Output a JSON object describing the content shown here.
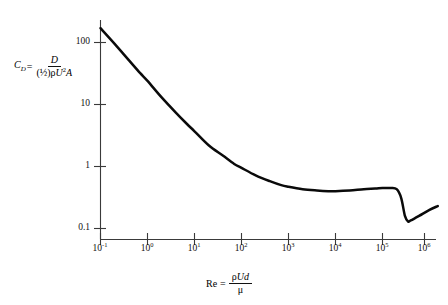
{
  "figure": {
    "background_color": "#ffffff",
    "curve_color": "#0a0a0a",
    "axis_color": "#3a3a3a"
  },
  "axis_titles": {
    "y": {
      "lhs_symbol": "C",
      "lhs_subscript": "D",
      "equals": "=",
      "numerator": "D",
      "denominator_prefix": "(½)",
      "denominator_rho": "ρ",
      "denominator_u": "U",
      "denominator_exp": "2",
      "denominator_area": "A",
      "plain": "C_D = D / ((½)ρU²A)"
    },
    "x": {
      "lhs": "Re",
      "equals": "=",
      "numerator_rho": "ρ",
      "numerator_u": "U",
      "numerator_d": "d",
      "denominator": "μ",
      "plain": "Re = ρUd / μ"
    }
  },
  "chart_data": {
    "type": "line",
    "title": "",
    "xlabel": "Re = ρUd/μ",
    "ylabel": "C_D = D/((½)ρU²A)",
    "xscale": "log",
    "yscale": "log",
    "xlim": [
      0.1,
      2000000
    ],
    "ylim": [
      0.07,
      300
    ],
    "grid": false,
    "legend": null,
    "xticks": [
      0.1,
      1,
      10,
      100,
      1000,
      10000,
      100000,
      1000000
    ],
    "xtick_labels": [
      "10-1",
      "100",
      "101",
      "102",
      "103",
      "104",
      "105",
      "106"
    ],
    "xtick_mantissa": [
      "10",
      "10",
      "10",
      "10",
      "10",
      "10",
      "10",
      "10"
    ],
    "xtick_exponents": [
      "-1",
      "0",
      "1",
      "2",
      "3",
      "4",
      "5",
      "6"
    ],
    "yticks": [
      0.1,
      1,
      10,
      100
    ],
    "ytick_labels": [
      "0.1",
      "1",
      "10",
      "100"
    ],
    "series": [
      {
        "name": "drag coefficient",
        "x": [
          0.1,
          0.2,
          0.4,
          0.7,
          1,
          2,
          4,
          7,
          10,
          20,
          40,
          70,
          100,
          200,
          400,
          700,
          1000,
          2000,
          4000,
          7000,
          10000,
          20000,
          40000,
          70000,
          100000,
          150000,
          200000,
          250000,
          300000,
          350000,
          400000,
          600000,
          1000000,
          1500000
        ],
        "y": [
          170,
          95,
          52,
          32,
          24,
          13,
          7.4,
          4.8,
          3.7,
          2.2,
          1.5,
          1.1,
          0.95,
          0.72,
          0.58,
          0.5,
          0.47,
          0.43,
          0.41,
          0.4,
          0.4,
          0.41,
          0.43,
          0.44,
          0.45,
          0.45,
          0.43,
          0.31,
          0.16,
          0.13,
          0.135,
          0.16,
          0.2,
          0.23
        ]
      }
    ],
    "annotations": [],
    "regimes_described": [
      "stokes-slope",
      "newton-plateau",
      "drag-crisis-dip",
      "post-crisis-rise"
    ]
  }
}
